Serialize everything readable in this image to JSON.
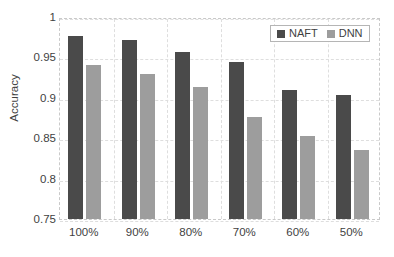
{
  "chart_data": {
    "type": "bar",
    "title": "",
    "xlabel": "",
    "ylabel": "Accuracy",
    "categories": [
      "100%",
      "90%",
      "80%",
      "70%",
      "60%",
      "50%"
    ],
    "series": [
      {
        "name": "NAFT",
        "color": "#4a4a4a",
        "values": [
          0.976,
          0.971,
          0.957,
          0.944,
          0.91,
          0.903
        ]
      },
      {
        "name": "DNN",
        "color": "#9d9d9d",
        "values": [
          0.94,
          0.929,
          0.914,
          0.876,
          0.853,
          0.836
        ]
      }
    ],
    "ylim": [
      0.75,
      1.0
    ],
    "ytick_labels": [
      "1",
      "0.95",
      "0.9",
      "0.85",
      "0.8",
      "0.75"
    ],
    "ytick_values": [
      1.0,
      0.95,
      0.9,
      0.85,
      0.8,
      0.75
    ],
    "grid": true,
    "legend_position": "top-right",
    "legend_entries": [
      "NAFT",
      "DNN"
    ]
  }
}
